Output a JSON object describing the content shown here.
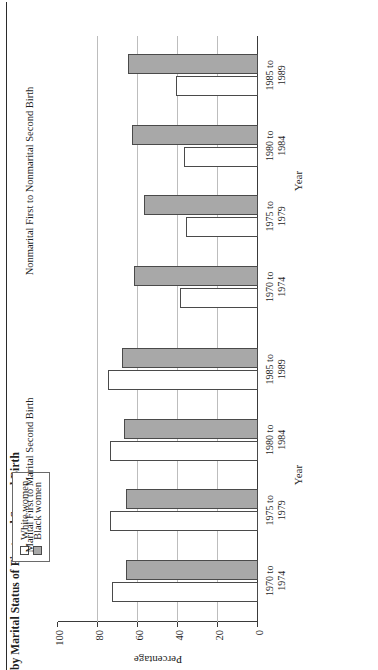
{
  "figure": {
    "title": "by Marital Status of First and Second Birth"
  },
  "legend": {
    "items": [
      {
        "label": "White women",
        "swatch": "open-square",
        "color": "#ffffff"
      },
      {
        "label": "Black women",
        "swatch": "filled-square",
        "color": "#a8a8a8"
      }
    ]
  },
  "axes": {
    "value_axis_title": "Percentage",
    "category_axis_title": "Year",
    "ticks": [
      "0",
      "20",
      "40",
      "60",
      "80",
      "100"
    ]
  },
  "chart_data": {
    "type": "bar",
    "title": "by Marital Status of First and Second Birth",
    "xlabel": "Year",
    "ylabel": "Percentage",
    "ylim": [
      0,
      100
    ],
    "grid": true,
    "legend_position": "top-left",
    "orientation": "horizontal-bars-rotated",
    "categories": [
      "1970 to 1974",
      "1975 to 1979",
      "1980 to 1984",
      "1985 to 1989"
    ],
    "panels": [
      {
        "title": "Marital First to Marital Second Birth",
        "series": [
          {
            "name": "White women",
            "values": [
              73,
              74,
              74,
              75
            ]
          },
          {
            "name": "Black women",
            "values": [
              66,
              66,
              67,
              68
            ]
          }
        ]
      },
      {
        "title": "Nonmarital First to Nonmarital Second Birth",
        "series": [
          {
            "name": "White women",
            "values": [
              39,
              36,
              37,
              41
            ]
          },
          {
            "name": "Black women",
            "values": [
              62,
              57,
              63,
              65
            ]
          }
        ]
      }
    ]
  }
}
